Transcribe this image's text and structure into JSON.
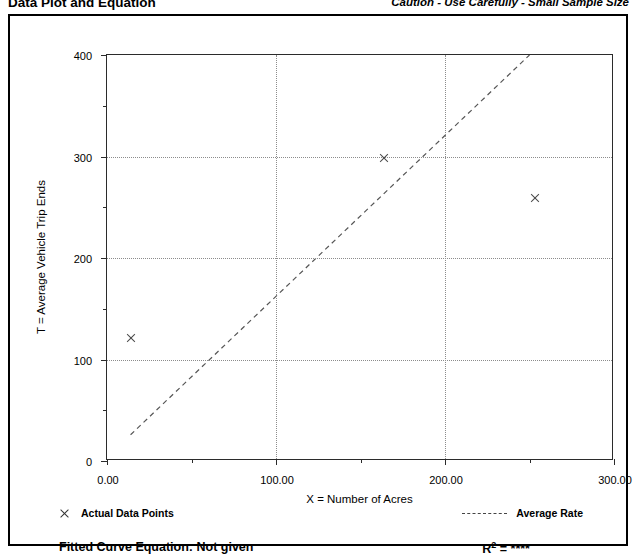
{
  "header": {
    "title_left": "Data Plot and Equation",
    "title_right": "Caution - Use Carefully - Small Sample Size"
  },
  "footer": {
    "fitted_curve_label": "Fitted Curve Equation:  Not given",
    "r2_label": "R",
    "r2_sup": "2",
    "r2_value": " = ****"
  },
  "legend": {
    "data_points_label": "Actual Data Points",
    "average_rate_label": "Average Rate",
    "marker_icon": "x-cross-icon",
    "line_icon": "dashed-line-icon"
  },
  "chart_data": {
    "type": "scatter",
    "title": "Data Plot and Equation",
    "subtitle": "Caution - Use Carefully - Small Sample Size",
    "xlabel": "X = Number of Acres",
    "ylabel": "T = Average Vehicle Trip Ends",
    "xlim": [
      0,
      300
    ],
    "ylim": [
      0,
      400
    ],
    "xticks": [
      0,
      100,
      200,
      300
    ],
    "xticklabels": [
      "0.00",
      "100.00",
      "200.00",
      "300.00"
    ],
    "xminorticks": [
      50,
      150,
      250
    ],
    "yticks": [
      0,
      100,
      200,
      300,
      400
    ],
    "yticklabels": [
      "0",
      "100",
      "200",
      "300",
      "400"
    ],
    "yminorticks": [
      50,
      150,
      250,
      350
    ],
    "grid": true,
    "grid_style": "dotted",
    "legend_position": "below-plot",
    "series": [
      {
        "name": "Actual Data Points",
        "type": "scatter",
        "marker": "x",
        "points": [
          {
            "x": 14,
            "y": 122
          },
          {
            "x": 164,
            "y": 299
          },
          {
            "x": 253,
            "y": 260
          }
        ]
      },
      {
        "name": "Average Rate",
        "type": "line",
        "style": "dashed",
        "points": [
          {
            "x": 14,
            "y": 24
          },
          {
            "x": 251,
            "y": 400
          }
        ]
      }
    ]
  }
}
